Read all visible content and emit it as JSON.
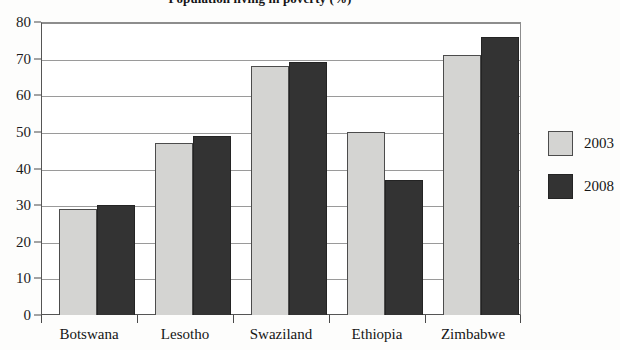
{
  "chart_data": {
    "type": "bar",
    "title": "Population living in poverty (%)",
    "subtitle": "",
    "xlabel": "",
    "ylabel": "",
    "categories": [
      "Botswana",
      "Lesotho",
      "Swaziland",
      "Ethiopia",
      "Zimbabwe"
    ],
    "series": [
      {
        "name": "2003",
        "color": "#d4d4d2",
        "values": [
          29,
          47,
          68,
          50,
          71
        ]
      },
      {
        "name": "2008",
        "color": "#333333",
        "values": [
          30,
          49,
          69,
          37,
          76
        ]
      }
    ],
    "ylim": [
      0,
      80
    ],
    "ytick_step": 10,
    "yticks": [
      80,
      70,
      60,
      50,
      40,
      30,
      20,
      10,
      0
    ],
    "grid": true,
    "grid_axis": "y",
    "legend_position": "right-outside"
  },
  "legend": {
    "items": [
      {
        "label": "2003"
      },
      {
        "label": "2008"
      }
    ]
  }
}
